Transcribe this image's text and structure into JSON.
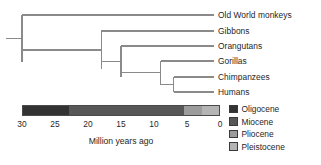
{
  "figure": {
    "type": "phylogenetic-tree-with-timescale",
    "background_color": "#ffffff",
    "branch_color": "#8a8a8a",
    "text_color": "#262626"
  },
  "tree": {
    "tips": [
      {
        "label": "Old World monkeys",
        "y": 15,
        "divergence_mya": 30
      },
      {
        "label": "Gibbons",
        "y": 31,
        "divergence_mya": 18
      },
      {
        "label": "Orangutans",
        "y": 46,
        "divergence_mya": 15
      },
      {
        "label": "Gorillas",
        "y": 61,
        "divergence_mya": 9
      },
      {
        "label": "Chimpanzees",
        "y": 77,
        "divergence_mya": 7
      },
      {
        "label": "Humans",
        "y": 92,
        "divergence_mya": 7
      }
    ],
    "nodes": [
      {
        "name": "root-catarrhini",
        "mya": 30,
        "children_y": [
          15,
          61.5
        ]
      },
      {
        "name": "hominoidea",
        "mya": 18,
        "children_y": [
          31,
          69
        ]
      },
      {
        "name": "hominidae",
        "mya": 15,
        "children_y": [
          46,
          77
        ]
      },
      {
        "name": "homininae",
        "mya": 9,
        "children_y": [
          61,
          84.5
        ]
      },
      {
        "name": "hominini",
        "mya": 7,
        "children_y": [
          77,
          92
        ]
      }
    ],
    "root_stem_mya_start": 32.5
  },
  "chart_data": {
    "type": "timeline",
    "title": "",
    "xlabel": "Million years ago",
    "xlim": [
      30,
      0
    ],
    "xticks": [
      30,
      25,
      20,
      15,
      10,
      5,
      0
    ],
    "xtick_labels": [
      "30",
      "25",
      "20",
      "15",
      "10",
      "5",
      "0"
    ],
    "axis_direction": "reversed",
    "grid": false,
    "epochs": [
      {
        "name": "Oligocene",
        "start_mya": 30,
        "end_mya": 23,
        "color": "#333333"
      },
      {
        "name": "Miocene",
        "start_mya": 23,
        "end_mya": 5.3,
        "color": "#575757"
      },
      {
        "name": "Pliocene",
        "start_mya": 5.3,
        "end_mya": 2.6,
        "color": "#9c9c9c"
      },
      {
        "name": "Pleistocene",
        "start_mya": 2.6,
        "end_mya": 0,
        "color": "#b4b4b4"
      }
    ],
    "series": [
      {
        "name": "divergence times",
        "points": [
          {
            "taxon": "Old World monkeys",
            "mya": 30
          },
          {
            "taxon": "Gibbons",
            "mya": 18
          },
          {
            "taxon": "Orangutans",
            "mya": 15
          },
          {
            "taxon": "Gorillas",
            "mya": 9
          },
          {
            "taxon": "Chimpanzees",
            "mya": 7
          },
          {
            "taxon": "Humans",
            "mya": 7
          }
        ]
      }
    ]
  },
  "legend": {
    "position": "right",
    "items": [
      {
        "label": "Oligocene",
        "color": "#333333"
      },
      {
        "label": "Miocene",
        "color": "#575757"
      },
      {
        "label": "Pliocene",
        "color": "#9c9c9c"
      },
      {
        "label": "Pleistocene",
        "color": "#b4b4b4"
      }
    ]
  }
}
